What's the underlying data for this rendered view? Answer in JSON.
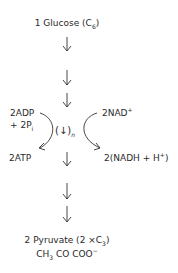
{
  "diagram": {
    "start": {
      "label": "1 Glucose (C",
      "sub": "6",
      "close": ")"
    },
    "left_in": {
      "line1": "2ADP",
      "line2": "+ 2P",
      "sub": "i"
    },
    "left_out": {
      "label": "2ATP"
    },
    "right_in": {
      "label": "2NAD",
      "sup": "+"
    },
    "right_out": {
      "label": "2(NADH + H",
      "sup": "+",
      "close": ")"
    },
    "center": {
      "label": "(↓)",
      "sub": "n"
    },
    "end": {
      "line1": "2 Pyruvate (2 ×C",
      "sub1": "3",
      "close1": ")",
      "line2a": "CH",
      "sub2": "3",
      "line2b": " CO COO",
      "sup2": "−"
    },
    "arrows": [
      "down-arrow",
      "down-arrow",
      "down-arrow",
      "down-arrow",
      "down-arrow",
      "down-arrow"
    ]
  }
}
